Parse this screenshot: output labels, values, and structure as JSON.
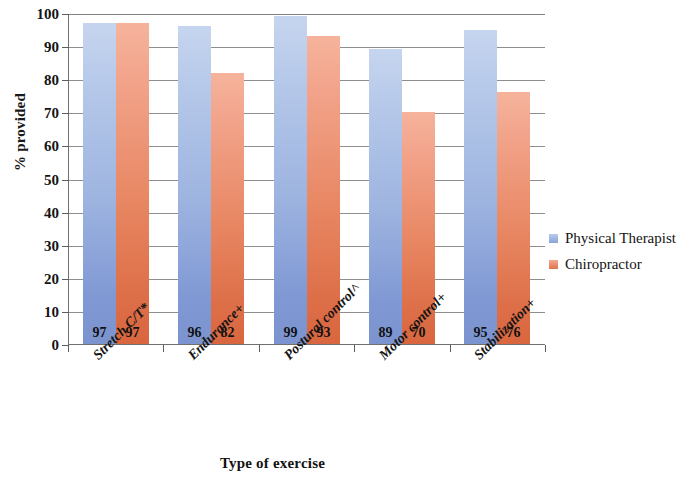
{
  "chart_data": {
    "type": "bar",
    "title": "",
    "xlabel": "Type of exercise",
    "ylabel": "% provided",
    "categories": [
      "Stretch C/T*",
      "Endurance+",
      "Postural control^",
      "Motor control+",
      "Stabilization+"
    ],
    "series": [
      {
        "name": "Physical Therapist",
        "color": "#9db4e0",
        "values": [
          97,
          96,
          99,
          89,
          95
        ]
      },
      {
        "name": "Chiropractor",
        "color": "#e88763",
        "values": [
          97,
          82,
          93,
          70,
          76
        ]
      }
    ],
    "ylim": [
      0,
      100
    ],
    "yticks": [
      0,
      10,
      20,
      30,
      40,
      50,
      60,
      70,
      80,
      90,
      100
    ],
    "ytick_labels": [
      "0",
      "10",
      "20",
      "30",
      "40",
      "50",
      "60",
      "70",
      "80",
      "90",
      "100"
    ],
    "grid": true,
    "grid_axis": "y",
    "legend_position": "right",
    "data_labels": true,
    "data_label_position": "inside-base"
  },
  "legend": {
    "items": [
      {
        "label": "Physical Therapist",
        "swatch": "pt"
      },
      {
        "label": "Chiropractor",
        "swatch": "dc"
      }
    ]
  }
}
